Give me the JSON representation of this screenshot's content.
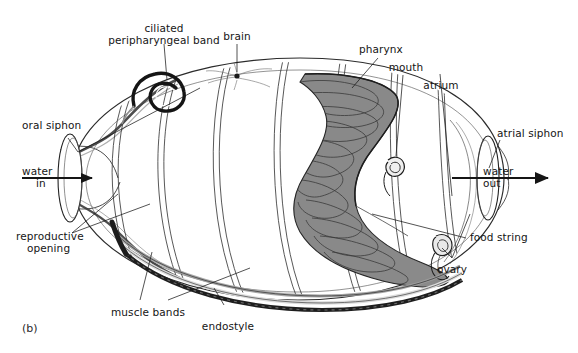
{
  "figure": {
    "panel_tag": "(b)",
    "style": "black-and-white scientific line drawing with gray shading"
  },
  "labels": {
    "ciliated_peripharyngeal_band_line1": "ciliated",
    "ciliated_peripharyngeal_band_line2": "peripharyngeal band",
    "brain": "brain",
    "pharynx": "pharynx",
    "mouth": "mouth",
    "atrium": "atrium",
    "atrial_siphon": "atrial siphon",
    "oral_siphon": "oral siphon",
    "water_in_line1": "water",
    "water_in_line2": "in",
    "water_out_line1": "water",
    "water_out_line2": "out",
    "reproductive_opening_line1": "reproductive",
    "reproductive_opening_line2": "opening",
    "muscle_bands": "muscle bands",
    "endostyle": "endostyle",
    "food_string": "food string",
    "ovary": "ovary"
  },
  "colors": {
    "ink": "#151515",
    "outline": "#2b2b2b",
    "pharynx_fill": "#8a8a8a",
    "pharynx_ridge": "#3a3a3a",
    "endostyle_dark": "#1e1e1e",
    "tunic_gray": "#b9b9b9",
    "background": "#ffffff"
  },
  "flow": {
    "inflow_direction": "left-to-right into oral siphon",
    "outflow_direction": "left-to-right out of atrial siphon"
  }
}
